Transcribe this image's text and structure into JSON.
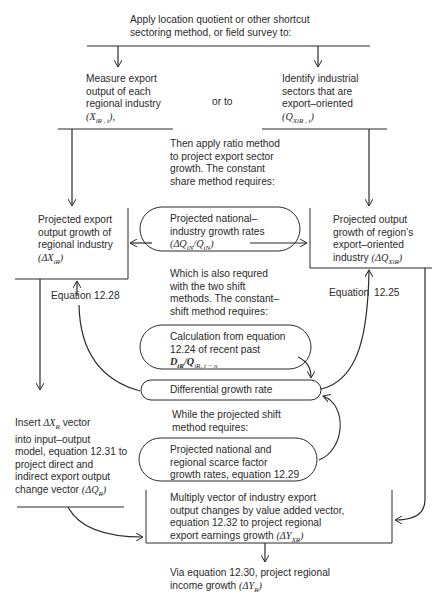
{
  "top": {
    "line1": "Apply location quotient or other shortcut",
    "line2": "sectoring method, or field survey to:"
  },
  "left_option": {
    "lines": [
      "Measure export",
      "output of each",
      "regional industry"
    ],
    "symbol": "(X",
    "symbol_sub": "iR , t",
    "symbol_end": "),"
  },
  "or_label": "or to",
  "right_option": {
    "lines": [
      "Identify industrial",
      "sectors that are",
      "export–oriented"
    ],
    "symbol": "(Q",
    "symbol_sub": "XiR , t",
    "symbol_end": ")"
  },
  "ratio_method": {
    "lines": [
      "Then apply ratio method",
      "to project export sector",
      "growth. The constant",
      "share method requires:"
    ]
  },
  "left_box": {
    "lines": [
      "Projected export",
      "output growth of",
      "regional industry"
    ],
    "symbol": "(ΔX",
    "symbol_sub": "iR",
    "symbol_end": ")"
  },
  "national_rates": {
    "lines": [
      "Projected national–",
      "industry growth rates"
    ],
    "symbol": "(ΔQ",
    "symbol_sub": "iN",
    "symbol_mid": "/Q",
    "symbol_sub2": "iN",
    "symbol_end": ")"
  },
  "right_box": {
    "lines": [
      "Projected output",
      "growth of region’s",
      "export–oriented"
    ],
    "last_line": "industry",
    "symbol": "(ΔQ",
    "symbol_sub": "XiR",
    "symbol_end": ")"
  },
  "shift_text": {
    "lines": [
      "Which is also requred",
      "with the two shift",
      "methods. The constant–",
      "shift method requires:"
    ]
  },
  "equation_left": "Equation  12.28",
  "equation_right_word": "Equation",
  "equation_right_num": "12.25",
  "calculation": {
    "lines": [
      "Calculation from equation",
      "12.24 of recent past"
    ],
    "symbol": "D",
    "symbol_sub": "iR",
    "symbol_mid": "/Q",
    "symbol_sub2": "iR, t − n"
  },
  "differential": "Differential growth rate",
  "projected_shift_text": {
    "lines": [
      "While the projected shift",
      "method requires:"
    ]
  },
  "scarce_factor": {
    "lines": [
      "Projected national and",
      "regional scarce factor",
      "growth rates, equation 12.29"
    ]
  },
  "io_model": {
    "line1_pre": "Insert ",
    "line1_sym": "ΔX",
    "line1_sub": "R",
    "line1_post": " vector",
    "lines": [
      "into input–output",
      "model, equation 12.31 to",
      "project direct and",
      "indirect export output"
    ],
    "last_pre": "change vector ",
    "symbol": "(ΔQ",
    "symbol_sub": "R",
    "symbol_end": ")"
  },
  "multiply_box": {
    "lines": [
      "Multiply vector of industry export",
      "output changes by value added vector,",
      "equation 12.32 to project regional"
    ],
    "last_pre": "export earnings growth ",
    "symbol": "(ΔY",
    "symbol_sub": "XR",
    "symbol_end": ")"
  },
  "income": {
    "line1": "Via equation 12.30, project regional",
    "line2_pre": "income growth ",
    "symbol": "(ΔY",
    "symbol_sub": "R",
    "symbol_end": ")"
  }
}
